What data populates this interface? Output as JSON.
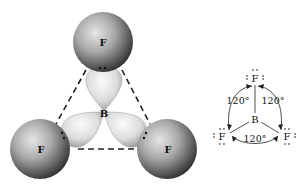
{
  "model_3d": {
    "central_atom": "B",
    "outer_atoms": [
      {
        "label": "F",
        "position": "top"
      },
      {
        "label": "F",
        "position": "bottom-left"
      },
      {
        "label": "F",
        "position": "bottom-right"
      }
    ],
    "bond_lobes": 3,
    "lone_pair_dots": 2
  },
  "lewis_structure": {
    "central_atom": "B",
    "outer_atoms": [
      {
        "label": "F",
        "position": "top"
      },
      {
        "label": "F",
        "position": "bottom-left"
      },
      {
        "label": "F",
        "position": "bottom-right"
      }
    ],
    "angles": [
      {
        "label": "120°",
        "position": "upper-left"
      },
      {
        "label": "120°",
        "position": "upper-right"
      },
      {
        "label": "120°",
        "position": "bottom"
      }
    ]
  },
  "colors": {
    "atom_dark": "#2b2b2b",
    "atom_light": "#d9d9d9",
    "lobe_light": "#f2f2f2",
    "lobe_shade": "#a8a8a8",
    "line": "#222222"
  }
}
